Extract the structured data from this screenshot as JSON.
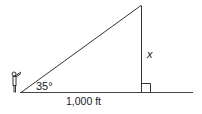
{
  "diagram": {
    "type": "right-triangle-angle-of-elevation",
    "angle_label": "35°",
    "base_label": "1,000 ft",
    "height_label": "x",
    "right_angle_marker": true,
    "observer": "person-figure",
    "colors": {
      "stroke": "#333333",
      "text": "#1a1a1a",
      "background": "#ffffff"
    }
  }
}
